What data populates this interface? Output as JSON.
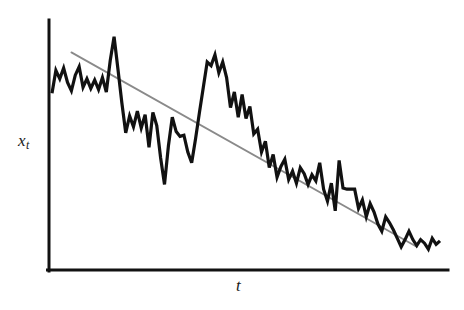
{
  "figure": {
    "title": "",
    "background_color": "#ffffff",
    "width": 464,
    "height": 310
  },
  "labels": {
    "ylabel_main": "x",
    "ylabel_sub": "t",
    "xlabel": "t"
  },
  "chart_data": {
    "type": "line",
    "title": "",
    "subtitle": "",
    "xlabel": "t",
    "ylabel": "x_t",
    "grid": false,
    "legend": null,
    "axis_style": {
      "x_axis_color": "#111111",
      "y_axis_color": "#111111",
      "x_axis_width": 3,
      "y_axis_width": 3,
      "ticks": "none",
      "tick_labels": "none",
      "spines": [
        "left",
        "bottom"
      ]
    },
    "xlim": [
      0,
      100
    ],
    "ylim": [
      0,
      100
    ],
    "series": [
      {
        "name": "series",
        "label": "x_t (random walk with negative drift)",
        "color": "#111111",
        "width": 3.2,
        "x": [
          0,
          1.0,
          2.0,
          3.0,
          4.0,
          5.0,
          6.0,
          7.0,
          8.0,
          9.0,
          10.0,
          11.0,
          12.0,
          13.0,
          14.0,
          15.0,
          16.0,
          17.0,
          18.0,
          19.0,
          20.0,
          21.0,
          22.0,
          23.0,
          24.0,
          25.0,
          26.0,
          27.0,
          28.0,
          29.0,
          30.0,
          31.0,
          32.0,
          33.0,
          34.0,
          35.0,
          36.0,
          37.0,
          38.0,
          39.0,
          40.0,
          41.0,
          42.0,
          43.0,
          44.0,
          45.0,
          46.0,
          47.0,
          48.0,
          49.0,
          50.0,
          51.0,
          52.0,
          53.0,
          54.0,
          55.0,
          56.0,
          57.0,
          58.0,
          59.0,
          60.0,
          61.0,
          62.0,
          63.0,
          64.0,
          65.0,
          66.0,
          67.0,
          68.0,
          69.0,
          70.0,
          71.0,
          72.0,
          73.0,
          74.0,
          75.0,
          76.0,
          77.0,
          78.0,
          79.0,
          80.0,
          81.0,
          82.0,
          83.0,
          84.0,
          85.0,
          86.0,
          87.0,
          88.0,
          89.0,
          90.0,
          91.0,
          92.0,
          93.0,
          94.0,
          95.0,
          96.0,
          97.0,
          98.0,
          99.0,
          100.0
        ],
        "y": [
          72.0,
          81.5,
          78.0,
          82.5,
          76.5,
          73.0,
          79.5,
          83.0,
          74.5,
          78.0,
          74.0,
          77.5,
          73.5,
          78.5,
          72.5,
          85.5,
          95.5,
          82.0,
          68.0,
          55.5,
          62.5,
          58.0,
          64.5,
          57.5,
          63.0,
          49.5,
          64.0,
          58.5,
          45.0,
          34.0,
          50.0,
          62.0,
          56.0,
          54.0,
          54.5,
          47.5,
          43.0,
          53.0,
          64.0,
          74.5,
          85.0,
          83.5,
          88.0,
          80.5,
          85.0,
          78.5,
          66.0,
          72.5,
          62.0,
          71.5,
          61.5,
          66.5,
          55.0,
          57.0,
          47.5,
          52.0,
          41.0,
          46.5,
          37.0,
          41.5,
          44.5,
          36.0,
          39.5,
          34.5,
          41.0,
          38.5,
          34.0,
          38.0,
          35.5,
          43.0,
          32.0,
          27.0,
          34.5,
          23.0,
          44.0,
          32.5,
          32.0,
          32.0,
          32.0,
          24.0,
          27.5,
          20.5,
          26.0,
          22.5,
          17.5,
          14.5,
          20.5,
          18.0,
          15.0,
          11.5,
          8.0,
          11.0,
          14.5,
          11.0,
          8.5,
          11.0,
          9.5,
          7.0,
          11.5,
          9.0,
          10.5
        ]
      }
    ],
    "trend_line": {
      "name": "fitted trend",
      "label": "linear trend (negative slope)",
      "color": "#8a8a8a",
      "width": 1.8,
      "x_start": 5.0,
      "y_start": 89.0,
      "x_end": 94.0,
      "y_end": 8.0
    }
  }
}
